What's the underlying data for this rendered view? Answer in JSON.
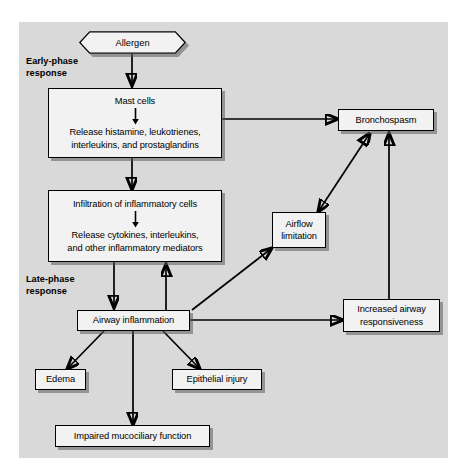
{
  "figure": {
    "type": "flowchart",
    "background_color": "#d9d9d9",
    "node_fill_color": "#f2f2f2",
    "line_color": "#000000"
  },
  "labels": {
    "early_phase": "Early-phase\nresponse",
    "early_phase_line1": "Early-phase",
    "early_phase_line2": "response",
    "late_phase_line1": "Late-phase",
    "late_phase_line2": "response"
  },
  "nodes": {
    "allergen": {
      "label": "Allergen",
      "shape": "hexagon"
    },
    "mast_cells": {
      "line1": "Mast cells",
      "line2": "Release histamine, leukotrienes,",
      "line3": "interleukins, and prostaglandins",
      "shape": "rect"
    },
    "infiltration": {
      "line1": "Infiltration of inflammatory cells",
      "line2": "Release cytokines, interleukins,",
      "line3": "and other inflammatory mediators",
      "shape": "rect"
    },
    "airway_inflammation": {
      "label": "Airway inflammation",
      "shape": "rect"
    },
    "bronchospasm": {
      "label": "Bronchospasm",
      "shape": "rect"
    },
    "airflow_limitation": {
      "line1": "Airflow",
      "line2": "limitation",
      "shape": "rect"
    },
    "increased_responsiveness": {
      "line1": "Increased airway",
      "line2": "responsiveness",
      "shape": "rect"
    },
    "edema": {
      "label": "Edema",
      "shape": "rect"
    },
    "epithelial_injury": {
      "label": "Epithelial injury",
      "shape": "rect"
    },
    "impaired_mucociliary": {
      "label": "Impaired mucociliary function",
      "shape": "rect"
    }
  },
  "edges": [
    {
      "from": "allergen",
      "to": "mast_cells",
      "style": "single-arrow",
      "direction": "down"
    },
    {
      "from": "mast_cells",
      "to": "bronchospasm",
      "style": "single-arrow",
      "direction": "right"
    },
    {
      "from": "mast_cells",
      "to": "infiltration",
      "style": "single-arrow",
      "direction": "down"
    },
    {
      "from": "infiltration",
      "to": "airway_inflammation",
      "style": "single-arrow",
      "direction": "down"
    },
    {
      "from": "airway_inflammation",
      "to": "infiltration",
      "style": "single-arrow",
      "direction": "up"
    },
    {
      "from": "airway_inflammation",
      "to": "airflow_limitation",
      "style": "single-arrow",
      "direction": "diagonal-up-right"
    },
    {
      "from": "airway_inflammation",
      "to": "increased_responsiveness",
      "style": "single-arrow",
      "direction": "right"
    },
    {
      "from": "airway_inflammation",
      "to": "edema",
      "style": "single-arrow",
      "direction": "diagonal-down-left"
    },
    {
      "from": "airway_inflammation",
      "to": "epithelial_injury",
      "style": "single-arrow",
      "direction": "diagonal-down-right"
    },
    {
      "from": "airway_inflammation",
      "to": "impaired_mucociliary",
      "style": "single-arrow",
      "direction": "down"
    },
    {
      "from": "bronchospasm",
      "to": "airflow_limitation",
      "style": "double-arrow",
      "direction": "diagonal"
    },
    {
      "from": "increased_responsiveness",
      "to": "bronchospasm",
      "style": "single-arrow",
      "direction": "up"
    }
  ]
}
